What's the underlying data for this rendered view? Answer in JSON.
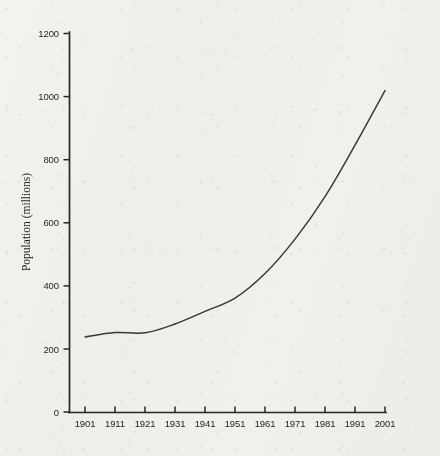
{
  "chart_data": {
    "type": "line",
    "title": "",
    "subtitle": "",
    "xlabel": "",
    "ylabel": "Population (millions)",
    "x": [
      1901,
      1911,
      1921,
      1931,
      1941,
      1951,
      1961,
      1971,
      1981,
      1991,
      2001
    ],
    "categories": [
      "1901",
      "1911",
      "1921",
      "1931",
      "1941",
      "1951",
      "1961",
      "1971",
      "1981",
      "1991",
      "2001"
    ],
    "values": [
      238,
      252,
      251,
      279,
      319,
      361,
      439,
      548,
      683,
      846,
      1019
    ],
    "series": [
      {
        "name": "Population",
        "values": [
          238,
          252,
          251,
          279,
          319,
          361,
          439,
          548,
          683,
          846,
          1019
        ]
      }
    ],
    "xlim": [
      1901,
      2011
    ],
    "ylim": [
      0,
      1200
    ],
    "ytick_labels": [
      "0",
      "200",
      "400",
      "600",
      "800",
      "1000",
      "1200"
    ],
    "ytick_values": [
      0,
      200,
      400,
      600,
      800,
      1000,
      1200
    ],
    "xtick_labels": [
      "1901",
      "1911",
      "1921",
      "1931",
      "1941",
      "1951",
      "1961",
      "1971",
      "1981",
      "1991",
      "2001"
    ],
    "xtick_values": [
      1901,
      1911,
      1921,
      1931,
      1941,
      1951,
      1961,
      1971,
      1981,
      1991,
      2001
    ],
    "grid": false,
    "legend": false,
    "legend_position": "none",
    "line_color": "#3a3734",
    "axis_color": "#2a2724",
    "background_color": "#f8f7f5"
  },
  "axes": {
    "y_axis_label": "Population (millions)",
    "y_ticks": [
      {
        "label": "1200",
        "value": 1200
      },
      {
        "label": "1000",
        "value": 1000
      },
      {
        "label": "800",
        "value": 800
      },
      {
        "label": "600",
        "value": 600
      },
      {
        "label": "400",
        "value": 400
      },
      {
        "label": "200",
        "value": 200
      },
      {
        "label": "0",
        "value": 0
      }
    ],
    "x_ticks": [
      {
        "label": "1901",
        "value": 1901
      },
      {
        "label": "1911",
        "value": 1911
      },
      {
        "label": "1921",
        "value": 1921
      },
      {
        "label": "1931",
        "value": 1931
      },
      {
        "label": "1941",
        "value": 1941
      },
      {
        "label": "1951",
        "value": 1951
      },
      {
        "label": "1961",
        "value": 1961
      },
      {
        "label": "1971",
        "value": 1971
      },
      {
        "label": "1981",
        "value": 1981
      },
      {
        "label": "1991",
        "value": 1991
      },
      {
        "label": "2001",
        "value": 2001
      }
    ]
  }
}
